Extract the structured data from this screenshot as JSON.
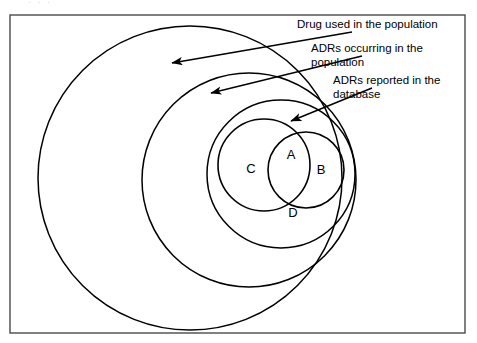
{
  "figure": {
    "type": "venn-diagram",
    "title_partial_cutoff": "· · ·",
    "frame": {
      "x": 10,
      "y": 15,
      "width": 455,
      "height": 318,
      "stroke_color": "#4a4a4a"
    },
    "background_color": "#ffffff",
    "line_color": "#000000"
  },
  "sets": [
    {
      "id": "population",
      "name": "drug-used-in-population-circle",
      "cx": 190,
      "cy": 178,
      "r": 152,
      "label_ref": "callout_drug"
    },
    {
      "id": "adrs_occurring",
      "name": "adrs-occurring-circle",
      "cx": 249,
      "cy": 180,
      "r": 107,
      "label_ref": "callout_occurring"
    },
    {
      "id": "adrs_reported",
      "name": "adrs-reported-circle",
      "cx": 281,
      "cy": 174,
      "r": 74,
      "label_ref": "callout_reported"
    },
    {
      "id": "set_c",
      "name": "set-c-circle",
      "cx": 264,
      "cy": 165,
      "r": 46
    },
    {
      "id": "set_b",
      "name": "set-b-circle",
      "cx": 306,
      "cy": 170,
      "r": 38
    }
  ],
  "region_labels": [
    {
      "id": "A",
      "text": "A",
      "x": 291,
      "y": 156
    },
    {
      "id": "B",
      "text": "B",
      "x": 321,
      "y": 171
    },
    {
      "id": "C",
      "text": "C",
      "x": 251,
      "y": 170
    },
    {
      "id": "D",
      "text": "D",
      "x": 293,
      "y": 214
    }
  ],
  "callouts": [
    {
      "id": "callout_drug",
      "name": "callout-drug-used",
      "lines": [
        "Drug used in the population"
      ],
      "text_x": 297,
      "text_y": 20,
      "leader": {
        "x1": 352,
        "y1": 32,
        "x2": 172,
        "y2": 63
      },
      "arrow_at": "end"
    },
    {
      "id": "callout_occurring",
      "name": "callout-adrs-occurring",
      "lines": [
        "ADRs occurring in the",
        "population"
      ],
      "text_x": 311,
      "text_y": 44,
      "leader": {
        "x1": 362,
        "y1": 56,
        "x2": 211,
        "y2": 93
      },
      "arrow_at": "end"
    },
    {
      "id": "callout_reported",
      "name": "callout-adrs-reported",
      "lines": [
        "ADRs reported in the",
        "database"
      ],
      "text_x": 333,
      "text_y": 76,
      "leader": {
        "x1": 372,
        "y1": 88,
        "x2": 291,
        "y2": 121
      },
      "arrow_at": "end"
    }
  ],
  "chart_data": {
    "type": "venn",
    "title": "",
    "sets": [
      {
        "label": "Drug used in the population",
        "level": 1
      },
      {
        "label": "ADRs occurring in the population",
        "level": 2
      },
      {
        "label": "ADRs reported in the database",
        "level": 3
      }
    ],
    "regions": [
      "A",
      "B",
      "C",
      "D"
    ],
    "region_notes": [
      {
        "region": "A",
        "meaning": "intersection of C and B"
      },
      {
        "region": "B",
        "meaning": "right inner circle"
      },
      {
        "region": "C",
        "meaning": "left inner circle"
      },
      {
        "region": "D",
        "meaning": "ADRs reported in the database, outside C and B"
      }
    ],
    "legend_position": "top-right",
    "grid": false
  }
}
